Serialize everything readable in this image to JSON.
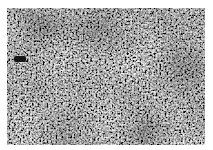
{
  "image": {
    "description": "Grayscale speckle / noise texture photograph with white margin",
    "palette": {
      "dark": "#1a1a1a",
      "mid": "#8a8a8a",
      "light": "#f2f2f2",
      "margin": "#ffffff"
    },
    "features": [
      {
        "name": "dark-blob",
        "approx_x": 14,
        "approx_y": 52
      }
    ]
  }
}
